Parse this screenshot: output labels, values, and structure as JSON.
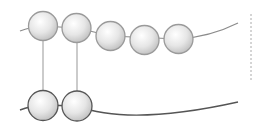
{
  "diagram": {
    "width": 254,
    "height": 137,
    "colors": {
      "background": "#ffffff",
      "top_strand": "#8c8c8c",
      "bottom_strand": "#555555",
      "top_bead_outline": "#9a9a9a",
      "bottom_bead_outline": "#555555",
      "connector": "#a8a8a8",
      "bead_highlight": "#ffffff",
      "bead_shadow": "#c4c4c4",
      "dotted_marker": "#aaaaaa"
    },
    "top_strand": {
      "label": "upper chain",
      "path": "M20,31 Q30,27 43,26 L76,28 Q95,32 110,36 L178,39 Q210,37 238,23",
      "beads": [
        {
          "cx": 43,
          "cy": 26,
          "r": 14.5
        },
        {
          "cx": 76.5,
          "cy": 28,
          "r": 14.5
        },
        {
          "cx": 110.5,
          "cy": 36,
          "r": 14.5
        },
        {
          "cx": 144.5,
          "cy": 40,
          "r": 14.5
        },
        {
          "cx": 178.5,
          "cy": 39,
          "r": 14.5
        }
      ]
    },
    "bottom_strand": {
      "label": "lower chain",
      "path": "M20,110 Q30,106 43,105 L77,106 Q130,126 238,102",
      "beads": [
        {
          "cx": 43,
          "cy": 105.5,
          "r": 15
        },
        {
          "cx": 77,
          "cy": 106,
          "r": 15
        }
      ]
    },
    "connectors": [
      {
        "x": 43,
        "y1": 40,
        "y2": 90
      },
      {
        "x": 77,
        "y1": 42,
        "y2": 91
      }
    ],
    "dotted_marker": {
      "x": 251,
      "y1": 14,
      "y2": 80
    }
  }
}
